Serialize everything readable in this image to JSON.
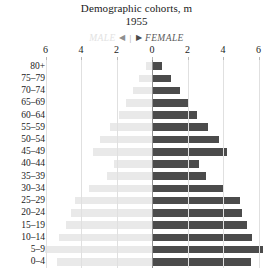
{
  "title": {
    "main": "Demographic cohorts, m",
    "sub": "1955"
  },
  "legend": {
    "male_label": "MALE",
    "female_label": "FEMALE",
    "left_arrow": "◀",
    "divider": "|",
    "right_arrow": "▶",
    "male_color": "#e9e9e9",
    "female_color": "#4b4b4b"
  },
  "axis": {
    "ticks": [
      "6",
      "4",
      "2",
      "0",
      "2",
      "4",
      "6"
    ],
    "tick_values": [
      -6,
      -4,
      -2,
      0,
      2,
      4,
      6
    ],
    "xlabel": "",
    "ylabel": ""
  },
  "chart_data": {
    "type": "bar",
    "subtype": "population-pyramid",
    "title": "Demographic cohorts, m",
    "subtitle": "1955",
    "xlabel": "",
    "ylabel": "",
    "xlim": [
      -6.6,
      6.6
    ],
    "grid": true,
    "legend_position": "top-center",
    "categories": [
      "80+",
      "75–79",
      "70–74",
      "65–69",
      "60–64",
      "55–59",
      "50–54",
      "45–49",
      "40–44",
      "35–39",
      "30–34",
      "25–29",
      "20–24",
      "15–19",
      "10–14",
      "5–9",
      "0–4"
    ],
    "series": [
      {
        "name": "MALE",
        "color": "#e9e9e9",
        "side": "left",
        "values": [
          0.35,
          0.75,
          1.05,
          1.45,
          1.85,
          2.35,
          2.95,
          3.35,
          2.15,
          2.55,
          3.55,
          4.35,
          4.55,
          4.85,
          5.25,
          6.05,
          5.35
        ]
      },
      {
        "name": "FEMALE",
        "color": "#4b4b4b",
        "side": "right",
        "values": [
          0.55,
          1.05,
          1.55,
          2.05,
          2.55,
          3.15,
          3.75,
          4.25,
          2.65,
          3.05,
          4.05,
          4.95,
          5.05,
          5.35,
          5.65,
          6.25,
          5.55
        ]
      }
    ]
  }
}
